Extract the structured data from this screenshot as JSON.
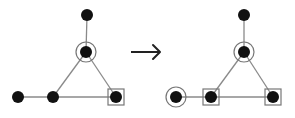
{
  "colors": {
    "background": "#ffffff",
    "node": "#111111",
    "edge": "#8a8a8a",
    "marker": "#777777",
    "arrow": "#222222"
  },
  "node_radius": 6,
  "ring_radius": 10,
  "box_half": 8,
  "graphs": [
    {
      "name": "before",
      "nodes": [
        {
          "id": "a",
          "x": 87,
          "y": 15,
          "marker": "none"
        },
        {
          "id": "b",
          "x": 86,
          "y": 52,
          "marker": "circle"
        },
        {
          "id": "c",
          "x": 18,
          "y": 97,
          "marker": "none"
        },
        {
          "id": "d",
          "x": 53,
          "y": 97,
          "marker": "none"
        },
        {
          "id": "e",
          "x": 116,
          "y": 97,
          "marker": "square"
        }
      ],
      "edges": [
        [
          "a",
          "b"
        ],
        [
          "b",
          "d"
        ],
        [
          "b",
          "e"
        ],
        [
          "c",
          "d"
        ],
        [
          "d",
          "e"
        ]
      ]
    },
    {
      "name": "after",
      "nodes": [
        {
          "id": "a",
          "x": 244,
          "y": 15,
          "marker": "none"
        },
        {
          "id": "b",
          "x": 244,
          "y": 52,
          "marker": "circle"
        },
        {
          "id": "c",
          "x": 176,
          "y": 97,
          "marker": "circle"
        },
        {
          "id": "d",
          "x": 211,
          "y": 97,
          "marker": "square"
        },
        {
          "id": "e",
          "x": 273,
          "y": 97,
          "marker": "square"
        }
      ],
      "edges": [
        [
          "a",
          "b"
        ],
        [
          "b",
          "d"
        ],
        [
          "b",
          "e"
        ],
        [
          "c",
          "d"
        ],
        [
          "d",
          "e"
        ]
      ]
    }
  ],
  "arrow": {
    "x1": 131,
    "y1": 52,
    "x2": 160,
    "y2": 52,
    "glyph": "right-arrow"
  }
}
